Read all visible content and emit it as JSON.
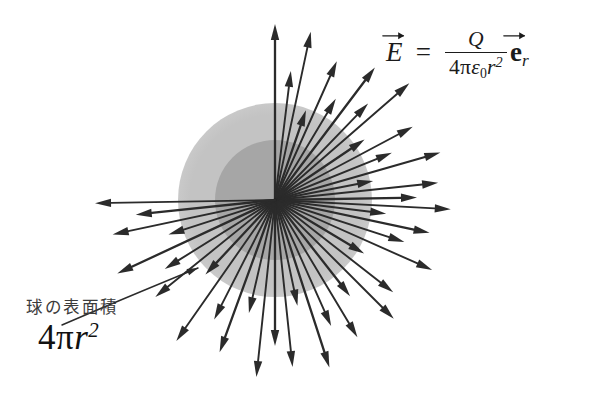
{
  "canvas": {
    "width": 589,
    "height": 396,
    "background": "#ffffff"
  },
  "diagram": {
    "type": "radial-vector-field",
    "center": {
      "x": 275,
      "y": 200
    },
    "spheres": [
      {
        "name": "outer-sphere",
        "radius": 97,
        "color": "#c3c3c3",
        "opacity": 0.95
      },
      {
        "name": "inner-sphere",
        "radius": 60,
        "color": "#a6a6a6",
        "opacity": 0.95
      }
    ],
    "arrow_color": "#2b2b2b",
    "arrow_count": 44,
    "arrows": [
      {
        "angle": -90.0,
        "length": 176
      },
      {
        "angle": -83.0,
        "length": 130
      },
      {
        "angle": -78.0,
        "length": 172
      },
      {
        "angle": -71.0,
        "length": 95
      },
      {
        "angle": -66.0,
        "length": 152
      },
      {
        "angle": -59.0,
        "length": 118
      },
      {
        "angle": -53.0,
        "length": 166
      },
      {
        "angle": -46.0,
        "length": 134
      },
      {
        "angle": -41.0,
        "length": 178
      },
      {
        "angle": -34.0,
        "length": 108
      },
      {
        "angle": -28.0,
        "length": 156
      },
      {
        "angle": -22.0,
        "length": 126
      },
      {
        "angle": -16.0,
        "length": 172
      },
      {
        "angle": -11.0,
        "length": 100
      },
      {
        "angle": -6.0,
        "length": 164
      },
      {
        "angle": -1.0,
        "length": 142
      },
      {
        "angle": 3.0,
        "length": 176
      },
      {
        "angle": 7.0,
        "length": 112
      },
      {
        "angle": 12.0,
        "length": 158
      },
      {
        "angle": 18.0,
        "length": 136
      },
      {
        "angle": 24.0,
        "length": 172
      },
      {
        "angle": 31.0,
        "length": 104
      },
      {
        "angle": 38.0,
        "length": 150
      },
      {
        "angle": 45.0,
        "length": 168
      },
      {
        "angle": 52.0,
        "length": 122
      },
      {
        "angle": 59.0,
        "length": 160
      },
      {
        "angle": 66.0,
        "length": 138
      },
      {
        "angle": 72.0,
        "length": 176
      },
      {
        "angle": 78.0,
        "length": 108
      },
      {
        "angle": 84.0,
        "length": 168
      },
      {
        "angle": 90.0,
        "length": 146
      },
      {
        "angle": 96.0,
        "length": 178
      },
      {
        "angle": 103.0,
        "length": 116
      },
      {
        "angle": 110.0,
        "length": 162
      },
      {
        "angle": 117.0,
        "length": 134
      },
      {
        "angle": 125.0,
        "length": 172
      },
      {
        "angle": 133.0,
        "length": 102
      },
      {
        "angle": 141.0,
        "length": 154
      },
      {
        "angle": 148.0,
        "length": 130
      },
      {
        "angle": 155.0,
        "length": 174
      },
      {
        "angle": 162.0,
        "length": 112
      },
      {
        "angle": 168.0,
        "length": 166
      },
      {
        "angle": 174.0,
        "length": 140
      },
      {
        "angle": 179.0,
        "length": 180
      }
    ],
    "leader": {
      "name": "caption-leader-arrow",
      "from": {
        "x": 62,
        "y": 325
      },
      "control": {
        "x": 120,
        "y": 300
      },
      "to": {
        "x": 198,
        "y": 268
      }
    }
  },
  "formula_field": {
    "name": "electric-field-equation",
    "latex": "\\vec{E} = \\frac{Q}{4\\pi\\varepsilon_0 r^2}\\vec{\\mathbf{e}}_r",
    "plain": "E = Q / (4 pi epsilon_0 r^2) e_r",
    "lhs": "E",
    "equals": "=",
    "numerator": "Q",
    "denominator": {
      "four": "4",
      "pi": "π",
      "epsilon": "ε",
      "epsilon_sub": "0",
      "r": "r",
      "r_exponent": "2"
    },
    "unit_vector": {
      "base": "e",
      "sub": "r"
    }
  },
  "caption": {
    "name": "sphere-surface-area-note",
    "label": "球の表面積",
    "label_romaji_meaning": "surface area of a sphere",
    "formula": {
      "four": "4",
      "pi": "π",
      "r": "r",
      "exponent": "2",
      "plain": "4πr²"
    }
  }
}
